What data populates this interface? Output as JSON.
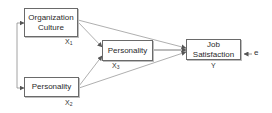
{
  "diagram": {
    "type": "path-model",
    "nodes": [
      {
        "id": "x1",
        "label": "Organization Culture",
        "line1": "Organization",
        "line2": "Culture",
        "var": "X",
        "sub": "1"
      },
      {
        "id": "x2",
        "label": "Personality",
        "var": "X",
        "sub": "2"
      },
      {
        "id": "x3",
        "label": "Personality",
        "var": "X",
        "sub": "3"
      },
      {
        "id": "y",
        "label": "Job Satisfaction",
        "var": "Y",
        "sub": ""
      }
    ],
    "error_term": "e",
    "edges": [
      {
        "from": "x1",
        "to": "x3"
      },
      {
        "from": "x1",
        "to": "y"
      },
      {
        "from": "x2",
        "to": "x3"
      },
      {
        "from": "x2",
        "to": "y"
      },
      {
        "from": "x3",
        "to": "y"
      },
      {
        "from": "e",
        "to": "y"
      },
      {
        "from": "x1",
        "to": "x2",
        "type": "correlation"
      }
    ],
    "colors": {
      "line": "#8a8a8a",
      "box_border": "#6a6a6a",
      "text": "#2a2a2a"
    }
  }
}
